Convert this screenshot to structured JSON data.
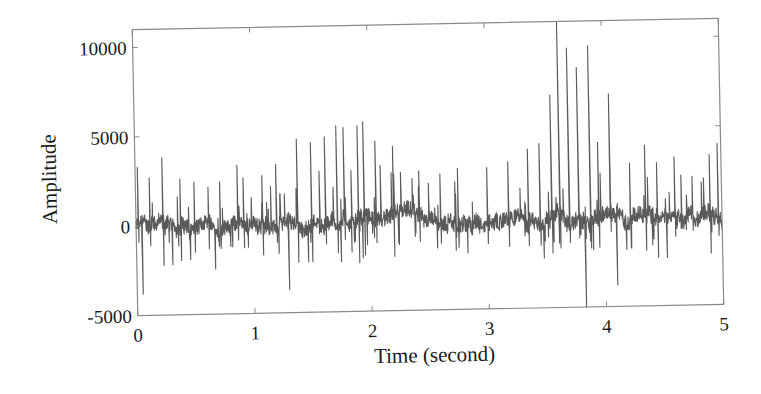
{
  "chart_data": {
    "type": "line",
    "title": "",
    "xlabel": "Time (second)",
    "ylabel": "Amplitude",
    "xlim": [
      0,
      5
    ],
    "ylim": [
      -5000,
      11000
    ],
    "xticks": [
      0,
      1,
      2,
      3,
      4,
      5
    ],
    "xtick_labels": [
      "0",
      "1",
      "2",
      "3",
      "4",
      "5"
    ],
    "yticks": [
      -5000,
      0,
      5000,
      10000
    ],
    "ytick_labels": [
      "-5000",
      "0",
      "5000",
      "10000"
    ],
    "grid": false,
    "legend": null,
    "line_color": "#5a5a5a",
    "sample_rate_note": "dense waveform, ~2000 samples over 5 s",
    "series": [
      {
        "name": "signal",
        "description": "ECG-like amplitude trace with periodic spikes; baseline near 0, spike bursts peak around 1.5-2.0 s and 3.5-4.2 s",
        "major_peaks": [
          {
            "t": 0.02,
            "v": 3300
          },
          {
            "t": 0.05,
            "v": -3800
          },
          {
            "t": 0.12,
            "v": 2700
          },
          {
            "t": 0.23,
            "v": 3800
          },
          {
            "t": 0.38,
            "v": 2600
          },
          {
            "t": 0.5,
            "v": 2400
          },
          {
            "t": 0.62,
            "v": 2100
          },
          {
            "t": 0.72,
            "v": 2400
          },
          {
            "t": 0.87,
            "v": 3300
          },
          {
            "t": 0.92,
            "v": 2600
          },
          {
            "t": 1.08,
            "v": 2700
          },
          {
            "t": 1.2,
            "v": 3300
          },
          {
            "t": 1.3,
            "v": -3700
          },
          {
            "t": 1.38,
            "v": 4700
          },
          {
            "t": 1.5,
            "v": 4500
          },
          {
            "t": 1.62,
            "v": 4800
          },
          {
            "t": 1.72,
            "v": 5400
          },
          {
            "t": 1.78,
            "v": 5300
          },
          {
            "t": 1.9,
            "v": 5400
          },
          {
            "t": 1.95,
            "v": 5600
          },
          {
            "t": 2.05,
            "v": 4500
          },
          {
            "t": 2.2,
            "v": 4200
          },
          {
            "t": 2.42,
            "v": 2800
          },
          {
            "t": 2.6,
            "v": 2600
          },
          {
            "t": 2.75,
            "v": 2900
          },
          {
            "t": 3.0,
            "v": 2900
          },
          {
            "t": 3.18,
            "v": 3200
          },
          {
            "t": 3.35,
            "v": 3900
          },
          {
            "t": 3.45,
            "v": 4200
          },
          {
            "t": 3.55,
            "v": 6900
          },
          {
            "t": 3.62,
            "v": 11000
          },
          {
            "t": 3.7,
            "v": 9500
          },
          {
            "t": 3.78,
            "v": 8400
          },
          {
            "t": 3.83,
            "v": -5000
          },
          {
            "t": 3.88,
            "v": 9600
          },
          {
            "t": 3.95,
            "v": 4200
          },
          {
            "t": 4.05,
            "v": 6900
          },
          {
            "t": 4.1,
            "v": -3800
          },
          {
            "t": 4.22,
            "v": 3000
          },
          {
            "t": 4.35,
            "v": 4000
          },
          {
            "t": 4.45,
            "v": 3000
          },
          {
            "t": 4.6,
            "v": 3300
          },
          {
            "t": 4.75,
            "v": 2200
          },
          {
            "t": 4.9,
            "v": 3400
          },
          {
            "t": 4.97,
            "v": 4000
          }
        ],
        "baseline_mean": 0,
        "typical_noise_range": [
          -1500,
          1500
        ]
      }
    ]
  },
  "figure": {
    "frame_color": "#8a8a8a",
    "background": "#ffffff",
    "rotation_deg": -1.1
  }
}
